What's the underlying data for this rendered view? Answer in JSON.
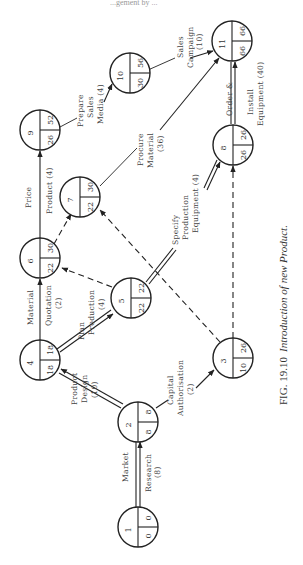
{
  "figure": {
    "caption_prefix": "FIG. 19.10",
    "caption_title": "Introduction of new Product.",
    "header_fragment": "...gement by ..."
  },
  "nodes": [
    {
      "id": "1",
      "earliest": "0",
      "latest": "0"
    },
    {
      "id": "2",
      "earliest": "8",
      "latest": "8"
    },
    {
      "id": "3",
      "earliest": "10",
      "latest": "26"
    },
    {
      "id": "4",
      "earliest": "18",
      "latest": "18"
    },
    {
      "id": "5",
      "earliest": "22",
      "latest": "22"
    },
    {
      "id": "6",
      "earliest": "22",
      "latest": "30"
    },
    {
      "id": "7",
      "earliest": "22",
      "latest": "30"
    },
    {
      "id": "8",
      "earliest": "26",
      "latest": "26"
    },
    {
      "id": "9",
      "earliest": "26",
      "latest": "52"
    },
    {
      "id": "10",
      "earliest": "30",
      "latest": "56"
    },
    {
      "id": "11",
      "earliest": "66",
      "latest": "66"
    }
  ],
  "activities": [
    {
      "from": "1",
      "to": "2",
      "line1": "Market",
      "line2": "Research",
      "line3": "(8)",
      "critical": true
    },
    {
      "from": "2",
      "to": "4",
      "line1": "Product",
      "line2": "Design",
      "line3": "(10)",
      "critical": true
    },
    {
      "from": "2",
      "to": "3",
      "line1": "Capital",
      "line2": "Authorisation",
      "line3": "(2)",
      "critical": false
    },
    {
      "from": "4",
      "to": "6",
      "line1": "Material",
      "line2": "Quotation",
      "line3": "(2)",
      "critical": false
    },
    {
      "from": "4",
      "to": "5",
      "line1": "Plan",
      "line2": "Production",
      "line3": "(4)",
      "critical": true
    },
    {
      "from": "6",
      "to": "9",
      "line1": "Price",
      "line2": "Product (4)",
      "critical": false
    },
    {
      "from": "9",
      "to": "10",
      "line1": "Prepare",
      "line2": "Sales",
      "line3": "Media (4)",
      "critical": false
    },
    {
      "from": "10",
      "to": "11",
      "line1": "Sales",
      "line2": "Campaign",
      "line3": "(10)",
      "critical": false
    },
    {
      "from": "7",
      "to": "11",
      "line1": "Procure",
      "line2": "Material",
      "line3": "(36)",
      "critical": false
    },
    {
      "from": "5",
      "to": "8",
      "line1": "Specify",
      "line2": "Production",
      "line3": "Equipment (4)",
      "critical": true
    },
    {
      "from": "8",
      "to": "11",
      "line1": "Order &",
      "line2": "Install",
      "line3": "Equipment (40)",
      "critical": true
    },
    {
      "from": "5",
      "to": "6",
      "dummy": true
    },
    {
      "from": "6",
      "to": "7",
      "dummy": true
    },
    {
      "from": "3",
      "to": "7",
      "dummy": true
    },
    {
      "from": "3",
      "to": "8",
      "dummy": true
    }
  ]
}
